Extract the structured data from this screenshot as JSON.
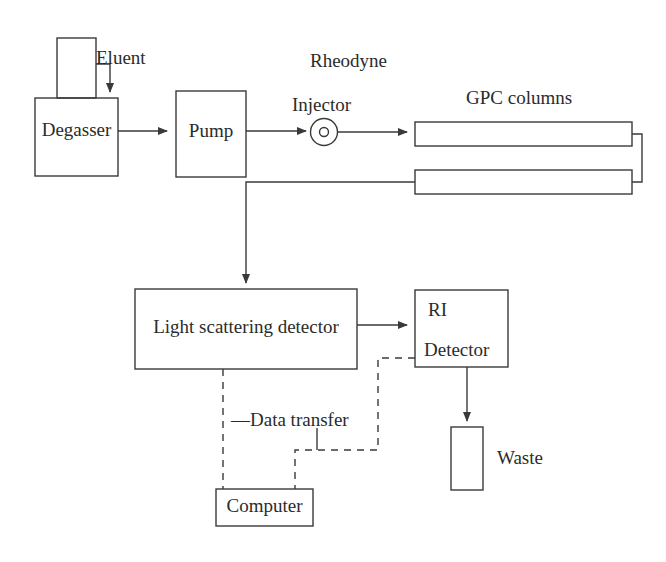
{
  "diagram": {
    "type": "flow-diagram",
    "background_color": "#ffffff",
    "line_color": "#3a3a3a",
    "text_color": "#2b2b2b"
  },
  "nodes": {
    "eluent_bottle": {
      "label": "",
      "shape": "rectangle"
    },
    "eluent_label": {
      "label": "Eluent"
    },
    "degasser": {
      "label": "Degasser",
      "shape": "rectangle"
    },
    "pump": {
      "label": "Pump",
      "shape": "rectangle"
    },
    "rheodyne_label": {
      "label": "Rheodyne"
    },
    "injector_label": {
      "label": "Injector"
    },
    "injector": {
      "label": "",
      "shape": "circle"
    },
    "gpc_columns_label": {
      "label": "GPC columns"
    },
    "column_top": {
      "label": "",
      "shape": "rectangle"
    },
    "column_bottom": {
      "label": "",
      "shape": "rectangle"
    },
    "light_scattering_detector": {
      "label": "Light scattering detector",
      "shape": "rectangle"
    },
    "ri_detector": {
      "label_line1": "RI",
      "label_line2": "Detector",
      "shape": "rectangle"
    },
    "waste_bottle": {
      "label": "",
      "shape": "rectangle"
    },
    "waste_label": {
      "label": "Waste"
    },
    "computer": {
      "label": "Computer",
      "shape": "rectangle"
    },
    "data_transfer_label": {
      "label": "Data transfer",
      "leader": "—"
    }
  },
  "connections": [
    {
      "name": "eluent-to-degasser",
      "from": "eluent_bottle",
      "to": "degasser",
      "style": "solid",
      "arrow": true
    },
    {
      "name": "degasser-to-pump",
      "from": "degasser",
      "to": "pump",
      "style": "solid",
      "arrow": true
    },
    {
      "name": "pump-to-injector",
      "from": "pump",
      "to": "injector",
      "style": "solid",
      "arrow": true
    },
    {
      "name": "injector-to-column-top",
      "from": "injector",
      "to": "column_top",
      "style": "solid",
      "arrow": true
    },
    {
      "name": "column-top-to-column-bottom",
      "from": "column_top",
      "to": "column_bottom",
      "style": "solid",
      "arrow": false
    },
    {
      "name": "column-bottom-to-light-scattering-detector",
      "from": "column_bottom",
      "to": "light_scattering_detector",
      "style": "solid",
      "arrow": true
    },
    {
      "name": "light-scattering-detector-to-ri-detector",
      "from": "light_scattering_detector",
      "to": "ri_detector",
      "style": "solid",
      "arrow": true
    },
    {
      "name": "ri-detector-to-waste",
      "from": "ri_detector",
      "to": "waste_bottle",
      "style": "solid",
      "arrow": true
    },
    {
      "name": "light-scattering-detector-to-computer",
      "from": "light_scattering_detector",
      "to": "computer",
      "style": "dashed",
      "arrow": false,
      "label": "Data transfer"
    },
    {
      "name": "ri-detector-to-computer",
      "from": "ri_detector",
      "to": "computer",
      "style": "dashed",
      "arrow": false,
      "label": "Data transfer"
    }
  ]
}
